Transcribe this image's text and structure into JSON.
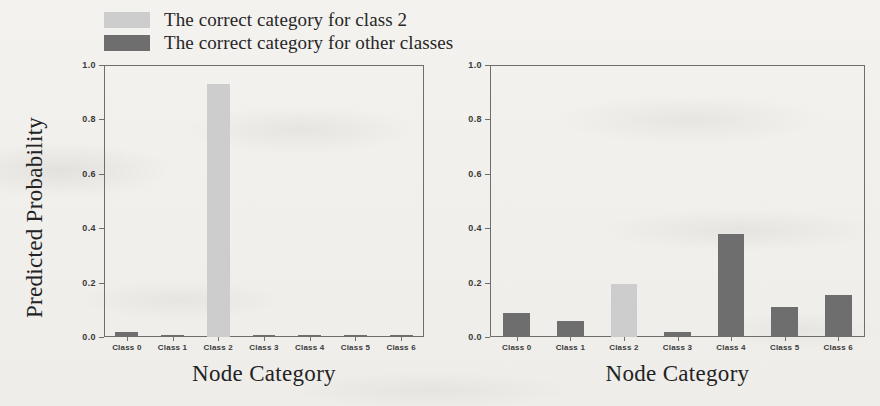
{
  "legend": {
    "items": [
      {
        "label": "The correct category for class 2",
        "color": "#cdcdcd",
        "swatch_name": "legend-swatch-class2"
      },
      {
        "label": "The correct category for other classes",
        "color": "#6e6e6e",
        "swatch_name": "legend-swatch-other"
      }
    ]
  },
  "colors": {
    "highlight": "#cdcdcd",
    "other": "#6e6e6e",
    "axis": "#6e6e6e",
    "text": "#262626",
    "paper": "#f2f1ee"
  },
  "chart_data": [
    {
      "id": "left",
      "type": "bar",
      "title": "",
      "xlabel": "Node Category",
      "ylabel": "Predicted Probability",
      "categories": [
        "Class 0",
        "Class 1",
        "Class 2",
        "Class 3",
        "Class 4",
        "Class 5",
        "Class 6"
      ],
      "values": [
        0.02,
        0.006,
        0.93,
        0.008,
        0.007,
        0.008,
        0.009
      ],
      "bar_colors": [
        "#6e6e6e",
        "#6e6e6e",
        "#cdcdcd",
        "#6e6e6e",
        "#6e6e6e",
        "#6e6e6e",
        "#6e6e6e"
      ],
      "ylim": [
        0.0,
        1.0
      ],
      "yticks": [
        "0.0",
        "0.2",
        "0.4",
        "0.6",
        "0.8",
        "1.0"
      ],
      "ytick_values": [
        0.0,
        0.2,
        0.4,
        0.6,
        0.8,
        1.0
      ],
      "grid": false,
      "legend_position": "above-left"
    },
    {
      "id": "right",
      "type": "bar",
      "title": "",
      "xlabel": "Node Category",
      "ylabel": "",
      "categories": [
        "Class 0",
        "Class 1",
        "Class 2",
        "Class 3",
        "Class 4",
        "Class 5",
        "Class 6"
      ],
      "values": [
        0.09,
        0.06,
        0.195,
        0.017,
        0.38,
        0.11,
        0.155
      ],
      "bar_colors": [
        "#6e6e6e",
        "#6e6e6e",
        "#cdcdcd",
        "#6e6e6e",
        "#6e6e6e",
        "#6e6e6e",
        "#6e6e6e"
      ],
      "ylim": [
        0.0,
        1.0
      ],
      "yticks": [
        "0.0",
        "0.2",
        "0.4",
        "0.6",
        "0.8",
        "1.0"
      ],
      "ytick_values": [
        0.0,
        0.2,
        0.4,
        0.6,
        0.8,
        1.0
      ],
      "grid": false,
      "legend_position": "none"
    }
  ]
}
